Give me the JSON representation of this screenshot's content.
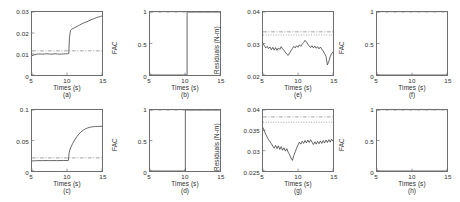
{
  "figure": {
    "background": "#ffffff",
    "axis_color": "#6e6e6e",
    "data_color": "#3a3a3a",
    "threshold_color": "#8a8a8a",
    "rows": 2,
    "cols": 4
  },
  "chart_data": [
    {
      "type": "line",
      "panel": "(a)",
      "title": "",
      "xlabel": "Times (s)",
      "ylabel": "Residuals (rad)",
      "xlim": [
        5,
        15
      ],
      "ylim": [
        0,
        0.03
      ],
      "xticks": [
        5,
        10,
        15
      ],
      "xticklabels": [
        "5",
        "10",
        "15"
      ],
      "yticks": [
        0,
        0.01,
        0.02,
        0.03
      ],
      "yticklabels": [
        "0",
        "0.01",
        "0.02",
        "0.03"
      ],
      "grid": false,
      "legend": "none",
      "series": [
        {
          "name": "residual",
          "style": "solid",
          "x": [
            5.0,
            5.3,
            5.6,
            5.9,
            6.2,
            6.5,
            6.8,
            7.1,
            7.4,
            7.7,
            8.0,
            8.3,
            8.6,
            8.9,
            9.2,
            9.5,
            9.8,
            10.1,
            10.25,
            10.35,
            10.5,
            10.7,
            10.9,
            11.2,
            11.5,
            11.8,
            12.1,
            12.4,
            12.7,
            13.0,
            13.3,
            13.6,
            13.9,
            14.2,
            14.5,
            14.8,
            15.0
          ],
          "y": [
            0.0092,
            0.0096,
            0.0099,
            0.01,
            0.01,
            0.0099,
            0.01,
            0.0101,
            0.01,
            0.0099,
            0.01,
            0.0101,
            0.01,
            0.0099,
            0.01,
            0.01,
            0.0101,
            0.0101,
            0.0103,
            0.0178,
            0.0213,
            0.0219,
            0.0222,
            0.0227,
            0.0232,
            0.0238,
            0.0243,
            0.0248,
            0.0252,
            0.0256,
            0.0261,
            0.0265,
            0.0269,
            0.0273,
            0.0276,
            0.0279,
            0.0281
          ]
        },
        {
          "name": "threshold",
          "style": "dashdot",
          "constant": 0.0115
        }
      ]
    },
    {
      "type": "line",
      "panel": "(b)",
      "title": "",
      "xlabel": "Times (s)",
      "ylabel": "FAC",
      "xlim": [
        5,
        15
      ],
      "ylim": [
        0,
        1
      ],
      "xticks": [
        5,
        10,
        15
      ],
      "xticklabels": [
        "5",
        "10",
        "15"
      ],
      "yticks": [
        0,
        0.5,
        1
      ],
      "yticklabels": [
        "0",
        "0.5",
        "1"
      ],
      "grid": false,
      "legend": "none",
      "series": [
        {
          "name": "fac",
          "style": "solid",
          "x": [
            5.0,
            10.3,
            10.3,
            15.0
          ],
          "y": [
            0,
            0,
            1,
            1
          ]
        },
        {
          "name": "reference",
          "style": "dashdot",
          "constant": 1.0
        }
      ]
    },
    {
      "type": "line",
      "panel": "(e)",
      "title": "",
      "xlabel": "Times (s)",
      "ylabel": "Residuals (N-m)",
      "xlim": [
        5,
        15
      ],
      "ylim": [
        0.02,
        0.04
      ],
      "xticks": [
        5,
        10,
        15
      ],
      "xticklabels": [
        "5",
        "10",
        "15"
      ],
      "yticks": [
        0.02,
        0.03,
        0.04
      ],
      "yticklabels": [
        "0.02",
        "0.03",
        "0.04"
      ],
      "grid": false,
      "legend": "none",
      "series": [
        {
          "name": "residual",
          "style": "solid",
          "x": [
            5.0,
            5.2,
            5.4,
            5.6,
            5.8,
            6.0,
            6.2,
            6.4,
            6.6,
            6.8,
            7.0,
            7.2,
            7.4,
            7.6,
            7.8,
            8.0,
            8.2,
            8.4,
            8.6,
            8.8,
            9.0,
            9.2,
            9.4,
            9.6,
            9.8,
            10.0,
            10.2,
            10.4,
            10.6,
            10.8,
            11.0,
            11.2,
            11.4,
            11.6,
            11.8,
            12.0,
            12.2,
            12.4,
            12.6,
            12.8,
            13.0,
            13.2,
            13.4,
            13.6,
            13.8,
            14.0,
            14.2,
            14.4,
            14.6,
            14.8,
            15.0
          ],
          "y": [
            0.03,
            0.0293,
            0.0286,
            0.0291,
            0.0284,
            0.0289,
            0.028,
            0.0288,
            0.0279,
            0.0287,
            0.0278,
            0.0286,
            0.0281,
            0.029,
            0.0283,
            0.0278,
            0.0272,
            0.0266,
            0.0262,
            0.027,
            0.0277,
            0.0284,
            0.0291,
            0.0286,
            0.0293,
            0.0288,
            0.0296,
            0.0291,
            0.0298,
            0.0303,
            0.031,
            0.0305,
            0.0298,
            0.0292,
            0.0287,
            0.0293,
            0.0286,
            0.0292,
            0.0285,
            0.029,
            0.0283,
            0.0289,
            0.0282,
            0.0276,
            0.0268,
            0.0259,
            0.0232,
            0.0243,
            0.0258,
            0.0268,
            0.0274
          ]
        },
        {
          "name": "threshold-upper",
          "style": "dashdot",
          "constant": 0.0337
        },
        {
          "name": "threshold-lower",
          "style": "dotted",
          "constant": 0.0327
        }
      ]
    },
    {
      "type": "line",
      "panel": "(f)",
      "title": "",
      "xlabel": "Times (s)",
      "ylabel": "FAC",
      "xlim": [
        5,
        15
      ],
      "ylim": [
        0,
        1
      ],
      "xticks": [
        5,
        10,
        15
      ],
      "xticklabels": [
        "5",
        "10",
        "15"
      ],
      "yticks": [
        0,
        0.5,
        1
      ],
      "yticklabels": [
        "0",
        "0.5",
        "1"
      ],
      "grid": false,
      "legend": "none",
      "series": [
        {
          "name": "fac",
          "style": "solid",
          "x": [
            5.0,
            15.0
          ],
          "y": [
            0,
            0
          ]
        },
        {
          "name": "reference",
          "style": "dashdot",
          "constant": 1.0
        }
      ]
    },
    {
      "type": "line",
      "panel": "(c)",
      "title": "",
      "xlabel": "Times (s)",
      "ylabel": "Residuals (rad)",
      "xlim": [
        5,
        15
      ],
      "ylim": [
        0,
        0.1
      ],
      "xticks": [
        5,
        10,
        15
      ],
      "xticklabels": [
        "5",
        "10",
        "15"
      ],
      "yticks": [
        0,
        0.05,
        0.1
      ],
      "yticklabels": [
        "0",
        "0.05",
        "0.1"
      ],
      "grid": false,
      "legend": "none",
      "series": [
        {
          "name": "residual",
          "style": "solid",
          "x": [
            5.0,
            5.5,
            6.0,
            6.5,
            7.0,
            7.5,
            8.0,
            8.5,
            9.0,
            9.5,
            10.0,
            10.2,
            10.3,
            10.5,
            10.8,
            11.1,
            11.4,
            11.7,
            12.0,
            12.3,
            12.6,
            12.9,
            13.2,
            13.5,
            13.8,
            14.1,
            14.4,
            14.7,
            15.0
          ],
          "y": [
            0.0165,
            0.0168,
            0.017,
            0.017,
            0.0171,
            0.017,
            0.0171,
            0.017,
            0.0171,
            0.0172,
            0.0172,
            0.0174,
            0.03,
            0.0378,
            0.0448,
            0.051,
            0.0562,
            0.0605,
            0.0641,
            0.0668,
            0.0689,
            0.0704,
            0.0715,
            0.0722,
            0.0727,
            0.073,
            0.0731,
            0.0732,
            0.0733
          ]
        },
        {
          "name": "threshold",
          "style": "dashdot",
          "constant": 0.0215
        }
      ]
    },
    {
      "type": "line",
      "panel": "(d)",
      "title": "",
      "xlabel": "Times (s)",
      "ylabel": "FAC",
      "xlim": [
        5,
        15
      ],
      "ylim": [
        0,
        1
      ],
      "xticks": [
        5,
        10,
        15
      ],
      "xticklabels": [
        "5",
        "10",
        "15"
      ],
      "yticks": [
        0,
        0.5,
        1
      ],
      "yticklabels": [
        "0",
        "0.5",
        "1"
      ],
      "grid": false,
      "legend": "none",
      "series": [
        {
          "name": "fac",
          "style": "solid",
          "x": [
            5.0,
            10.05,
            10.05,
            15.0
          ],
          "y": [
            0,
            0,
            1,
            1
          ]
        },
        {
          "name": "reference",
          "style": "dashdot",
          "constant": 1.0
        }
      ]
    },
    {
      "type": "line",
      "panel": "(g)",
      "title": "",
      "xlabel": "Times (s)",
      "ylabel": "Residuals (N-m)",
      "xlim": [
        5,
        15
      ],
      "ylim": [
        0.025,
        0.04
      ],
      "xticks": [
        5,
        10,
        15
      ],
      "xticklabels": [
        "5",
        "10",
        "15"
      ],
      "yticks": [
        0.025,
        0.03,
        0.035,
        0.04
      ],
      "yticklabels": [
        "0.025",
        "0.03",
        "0.035",
        "0.04"
      ],
      "grid": false,
      "legend": "none",
      "series": [
        {
          "name": "residual",
          "style": "solid",
          "x": [
            5.0,
            5.2,
            5.4,
            5.6,
            5.8,
            6.0,
            6.2,
            6.4,
            6.6,
            6.8,
            7.0,
            7.2,
            7.4,
            7.6,
            7.8,
            8.0,
            8.2,
            8.4,
            8.6,
            8.8,
            9.0,
            9.2,
            9.4,
            9.6,
            9.8,
            10.0,
            10.2,
            10.4,
            10.6,
            10.8,
            11.0,
            11.2,
            11.4,
            11.6,
            11.8,
            12.0,
            12.2,
            12.4,
            12.6,
            12.8,
            13.0,
            13.2,
            13.4,
            13.6,
            13.8,
            14.0,
            14.2,
            14.4,
            14.6,
            14.8,
            15.0
          ],
          "y": [
            0.0357,
            0.0348,
            0.034,
            0.0333,
            0.0327,
            0.0322,
            0.0317,
            0.0311,
            0.0306,
            0.0313,
            0.0305,
            0.0312,
            0.0303,
            0.031,
            0.0301,
            0.0307,
            0.0299,
            0.0305,
            0.0296,
            0.029,
            0.0282,
            0.0276,
            0.0288,
            0.0297,
            0.0306,
            0.0314,
            0.0321,
            0.0316,
            0.0323,
            0.0318,
            0.0325,
            0.0319,
            0.0326,
            0.032,
            0.0327,
            0.0321,
            0.0315,
            0.0322,
            0.0316,
            0.0323,
            0.0317,
            0.0324,
            0.0318,
            0.0325,
            0.0319,
            0.0326,
            0.032,
            0.0327,
            0.0321,
            0.0328,
            0.0323
          ]
        },
        {
          "name": "threshold-upper",
          "style": "dashdot",
          "constant": 0.0383
        },
        {
          "name": "threshold-lower",
          "style": "dotted",
          "constant": 0.037
        }
      ]
    },
    {
      "type": "line",
      "panel": "(h)",
      "title": "",
      "xlabel": "Times (s)",
      "ylabel": "FAC",
      "xlim": [
        5,
        15
      ],
      "ylim": [
        0,
        1
      ],
      "xticks": [
        5,
        10,
        15
      ],
      "xticklabels": [
        "5",
        "10",
        "15"
      ],
      "yticks": [
        0,
        0.5,
        1
      ],
      "yticklabels": [
        "0",
        "0.5",
        "1"
      ],
      "grid": false,
      "legend": "none",
      "series": [
        {
          "name": "fac",
          "style": "solid",
          "x": [
            5.0,
            15.0
          ],
          "y": [
            0,
            0
          ]
        },
        {
          "name": "reference",
          "style": "dashdot",
          "constant": 1.0
        }
      ]
    }
  ]
}
